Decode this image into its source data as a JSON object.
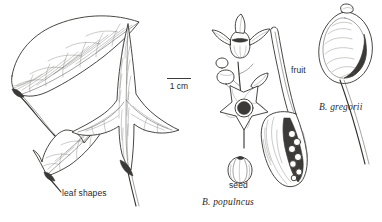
{
  "plate": {
    "kind": "botanical-line-drawing",
    "width": 382,
    "height": 222,
    "background_color": "#ffffff",
    "ink_color": "#2a2a2a"
  },
  "scale": {
    "bar_label": "1 cm",
    "bar_length_px": 24
  },
  "labels": {
    "leaf_shapes": "leaf shapes",
    "fruit": "fruit",
    "seed": "seed"
  },
  "taxa": {
    "populneus": "B. populncus",
    "gregorii": "B. gregorii"
  },
  "figures": [
    {
      "name": "large-ovate-leaf",
      "caption_ref": "leaf shapes"
    },
    {
      "name": "small-lobed-leaf",
      "caption_ref": "leaf shapes"
    },
    {
      "name": "trilobed-leaf",
      "caption_ref": "leaf shapes"
    },
    {
      "name": "inflorescence",
      "caption_ref": "B. populncus"
    },
    {
      "name": "follicle-fruit",
      "caption_ref": "fruit"
    },
    {
      "name": "seed",
      "caption_ref": "seed"
    },
    {
      "name": "gregorii-fruit",
      "caption_ref": "B. gregorii"
    }
  ]
}
